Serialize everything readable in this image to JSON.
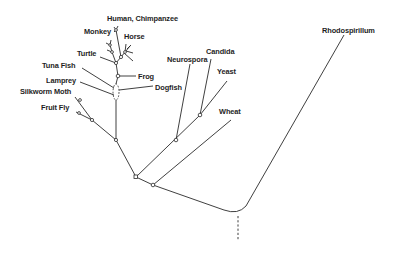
{
  "diagram": {
    "type": "phylogenetic-tree",
    "title": "",
    "line_color": "#2a2a2a",
    "text_color": "#1e1e1e",
    "taxa": [
      {
        "id": "human",
        "label": "Human, Chimpanzee"
      },
      {
        "id": "monkey",
        "label": "Monkey"
      },
      {
        "id": "horse",
        "label": "Horse"
      },
      {
        "id": "turtle",
        "label": "Turtle"
      },
      {
        "id": "tuna",
        "label": "Tuna Fish"
      },
      {
        "id": "frog",
        "label": "Frog"
      },
      {
        "id": "lamprey",
        "label": "Lamprey"
      },
      {
        "id": "dogfish",
        "label": "Dogfish"
      },
      {
        "id": "silkworm",
        "label": "Silkworm Moth"
      },
      {
        "id": "fruitfly",
        "label": "Fruit Fly"
      },
      {
        "id": "neurospora",
        "label": "Neurospora"
      },
      {
        "id": "candida",
        "label": "Candida"
      },
      {
        "id": "yeast",
        "label": "Yeast"
      },
      {
        "id": "wheat",
        "label": "Wheat"
      },
      {
        "id": "rhodospirillum",
        "label": "Rhodospirillum"
      }
    ],
    "root": {
      "style": "dashed"
    }
  }
}
